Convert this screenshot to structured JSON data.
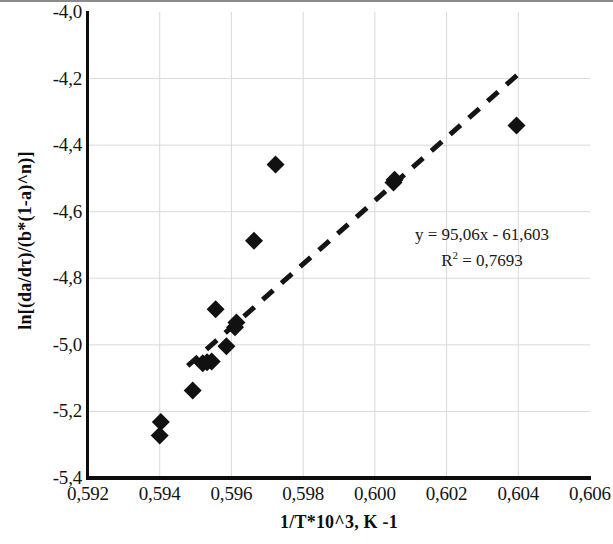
{
  "chart_data": {
    "type": "scatter",
    "title": "",
    "xlabel": "1/T*10^3, K -1",
    "ylabel": "ln[(da/dτ)/(b*(1-a)^n)]",
    "xlim": [
      0.592,
      0.606
    ],
    "ylim": [
      -5.4,
      -4.0
    ],
    "xtick_step": 0.002,
    "ytick_step": 0.2,
    "xticks": [
      "0,592",
      "0,594",
      "0,596",
      "0,598",
      "0,600",
      "0,602",
      "0,604",
      "0,606"
    ],
    "xtick_values": [
      0.592,
      0.594,
      0.596,
      0.598,
      0.6,
      0.602,
      0.604,
      0.606
    ],
    "yticks": [
      "-4,0",
      "-4,2",
      "-4,4",
      "-4,6",
      "-4,8",
      "-5,0",
      "-5,2",
      "-5,4"
    ],
    "ytick_values": [
      -4.0,
      -4.2,
      -4.4,
      -4.6,
      -4.8,
      -5.0,
      -5.2,
      -5.4
    ],
    "grid": true,
    "grid_color": "#d9d9d9",
    "legend": false,
    "marker": "diamond",
    "marker_color": "#111111",
    "marker_size": 9,
    "points": [
      {
        "x": 0.59403,
        "y": -5.232
      },
      {
        "x": 0.594,
        "y": -5.272
      },
      {
        "x": 0.59492,
        "y": -5.137
      },
      {
        "x": 0.5952,
        "y": -5.055
      },
      {
        "x": 0.59532,
        "y": -5.052
      },
      {
        "x": 0.59545,
        "y": -5.05
      },
      {
        "x": 0.59556,
        "y": -4.893
      },
      {
        "x": 0.59586,
        "y": -5.004
      },
      {
        "x": 0.5961,
        "y": -4.947
      },
      {
        "x": 0.59614,
        "y": -4.933
      },
      {
        "x": 0.59663,
        "y": -4.687
      },
      {
        "x": 0.59723,
        "y": -4.458
      },
      {
        "x": 0.60052,
        "y": -4.512
      },
      {
        "x": 0.60055,
        "y": -4.504
      },
      {
        "x": 0.60395,
        "y": -4.341
      }
    ],
    "trendline": {
      "style": "dashed",
      "color": "#141414",
      "slope": 95.06,
      "intercept": -61.603,
      "x_start": 0.59478,
      "x_end": 0.60408,
      "label_equation": "y = 95,06x - 61,603",
      "label_r2_prefix": "R",
      "label_r2_sup": "2",
      "label_r2_value": " = 0,7693"
    }
  },
  "annotations": {
    "equation": "y = 95,06x - 61,603",
    "r2_prefix": "R",
    "r2_superscript": "2",
    "r2_rest": " = 0,7693"
  },
  "axes": {
    "x_title": "1/T*10^3, K -1",
    "y_title": "ln[(da/dτ)/(b*(1-a)^n)]"
  }
}
